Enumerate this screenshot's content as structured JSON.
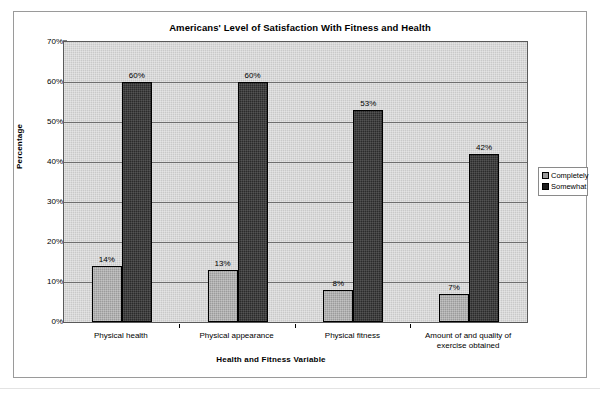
{
  "chart_data": {
    "type": "bar",
    "title": "Americans' Level of Satisfaction With Fitness and Health",
    "xlabel": "Health and Fitness Variable",
    "ylabel": "Percentage",
    "categories": [
      "Physical health",
      "Physical appearance",
      "Physical fitness",
      "Amount of and quality of exercise obtained"
    ],
    "series": [
      {
        "name": "Completely",
        "color": "#9b9b9b",
        "values": [
          14,
          13,
          8,
          7
        ],
        "labels": [
          "14%",
          "13%",
          "8%",
          "7%"
        ]
      },
      {
        "name": "Somewhat",
        "color": "#2b2b2b",
        "values": [
          60,
          60,
          53,
          42
        ],
        "labels": [
          "60%",
          "60%",
          "53%",
          "42%"
        ]
      }
    ],
    "ylim": [
      0,
      70
    ],
    "ytick_values": [
      0,
      10,
      20,
      30,
      40,
      50,
      60,
      70
    ],
    "ytick_labels": [
      "0%",
      "10%",
      "20%",
      "30%",
      "40%",
      "50%",
      "60%",
      "70%"
    ],
    "grid": true,
    "legend_position": "right",
    "plot_background": "#c9c9c9",
    "plot_border": "#5a5a5a"
  },
  "legend": {
    "entries": [
      {
        "label": "Completely"
      },
      {
        "label": "Somewhat"
      }
    ]
  }
}
